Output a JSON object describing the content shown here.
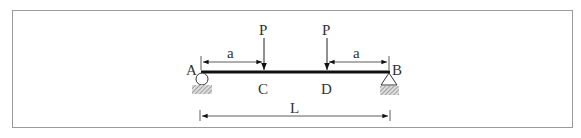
{
  "diagram": {
    "type": "simply-supported-beam",
    "supports": {
      "left": {
        "label": "A",
        "kind": "roller"
      },
      "right": {
        "label": "B",
        "kind": "pin"
      }
    },
    "loads": [
      {
        "label": "P",
        "at_point": "C"
      },
      {
        "label": "P",
        "at_point": "D"
      }
    ],
    "points": {
      "C": "C",
      "D": "D"
    },
    "dimensions": {
      "left_a": "a",
      "right_a": "a",
      "span": "L"
    },
    "colors": {
      "line": "#1a1a1a",
      "frame": "#999999",
      "hatch": "#888888"
    }
  }
}
